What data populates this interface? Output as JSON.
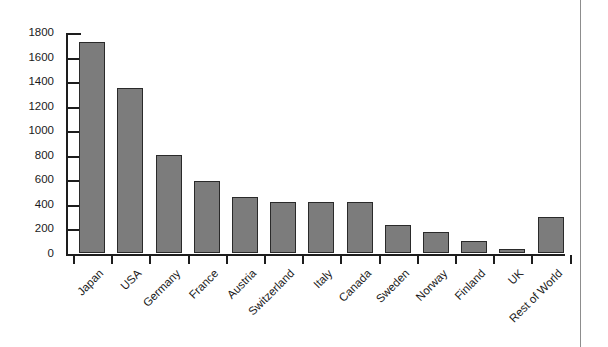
{
  "chart_data": {
    "type": "bar",
    "title": "",
    "subtitle": "",
    "xlabel": "",
    "ylabel": "",
    "categories": [
      "Japan",
      "USA",
      "Germany",
      "France",
      "Austria",
      "Switzerland",
      "Italy",
      "Canada",
      "Sweden",
      "Norway",
      "Finland",
      "UK",
      "Rest of World"
    ],
    "values": [
      1720,
      1340,
      800,
      590,
      460,
      415,
      415,
      415,
      225,
      170,
      95,
      35,
      290
    ],
    "ylim": [
      0,
      1800
    ],
    "ytick_step": 200,
    "yticks": [
      0,
      200,
      400,
      600,
      800,
      1000,
      1200,
      1400,
      1600,
      1800
    ],
    "ytick_labels": [
      "0",
      "200",
      "400",
      "600",
      "800",
      "1000",
      "1200",
      "1400",
      "1600",
      "1800"
    ],
    "grid": false,
    "legend": false,
    "legend_position": "none",
    "bar_color": "#7c7c7c",
    "bar_edge_color": "#2a2a2a",
    "axis_color": "#1d1d1d",
    "background_color": "#ffffff",
    "label_rotation_degrees": 45,
    "x_tick_placement": "category-boundaries",
    "y_tick_direction": "inward"
  },
  "page": {
    "rule_color": "#8d8d8d"
  }
}
